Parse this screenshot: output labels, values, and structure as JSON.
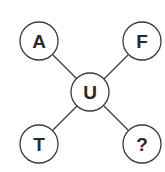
{
  "diagram": {
    "type": "letter-puzzle",
    "center": {
      "letter": "U"
    },
    "nodes": [
      {
        "position": "top-left",
        "letter": "A"
      },
      {
        "position": "top-right",
        "letter": "F"
      },
      {
        "position": "bottom-left",
        "letter": "T"
      },
      {
        "position": "bottom-right",
        "letter": "?"
      }
    ],
    "colors": {
      "stroke": "#3a3a3a",
      "text": "#2a2a2a",
      "background": "#ffffff"
    }
  }
}
